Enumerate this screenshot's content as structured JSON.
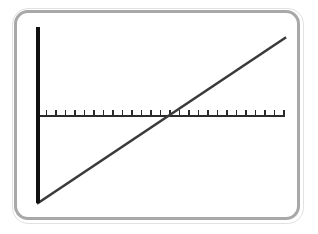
{
  "figure": {
    "kind": "number-line-graph",
    "background_color": "#ffffff",
    "frame": {
      "border_color": "#a8a8a8",
      "border_width": 3,
      "corner_radius": 14,
      "x": 14,
      "y": 10,
      "width": 286,
      "height": 210
    }
  },
  "chart_data": {
    "type": "line",
    "title": "",
    "subtitle": "",
    "xlabel": "",
    "ylabel": "",
    "grid": false,
    "legend": null,
    "annotations": [],
    "axes": {
      "horizontal_axis": {
        "name": "x-axis",
        "color": "#2b2b2b",
        "stroke_width": 1.6,
        "x_start_px": 20,
        "x_end_px": 268,
        "y_px": 103,
        "tick_count": 27,
        "tick_spacing_px": 9.5,
        "tick_length_px": 6,
        "tick_direction": "up",
        "tick_labels": []
      },
      "vertical_axis": {
        "name": "y-axis",
        "color": "#101010",
        "stroke_width": 4.5,
        "x_px": 21,
        "y_top_px": 14,
        "y_bottom_px": 190,
        "tick_count": 0,
        "tick_labels": []
      }
    },
    "series": [
      {
        "name": "diagonal-line",
        "color": "#3a3a3a",
        "stroke_width": 2.6,
        "x": [
          21,
          268
        ],
        "y": [
          190,
          25
        ],
        "points_px": [
          {
            "x": 21,
            "y": 190
          },
          {
            "x": 268,
            "y": 25
          }
        ],
        "slope_sign": "positive",
        "crosses_x_axis_at_px": {
          "x": 151,
          "y": 103
        }
      }
    ],
    "xlim": [
      20,
      268
    ],
    "ylim": [
      14,
      190
    ]
  }
}
